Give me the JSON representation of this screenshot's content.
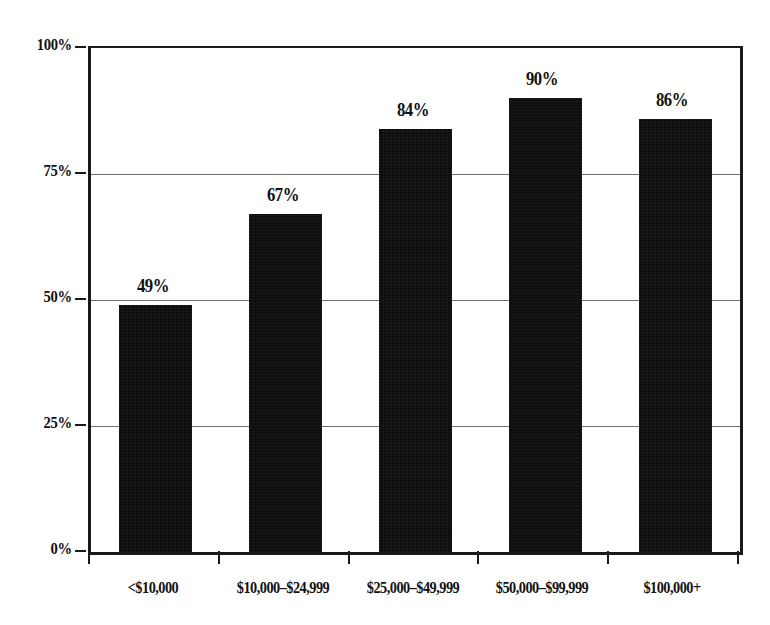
{
  "figure": {
    "title_remnant": "",
    "background_color": "#ffffff",
    "bar_color": "#0d0d0d",
    "axis_color": "#1a1a1a",
    "gridline_color": "#6f6f74"
  },
  "chart_data": {
    "type": "bar",
    "title": "",
    "xlabel": "",
    "ylabel": "",
    "categories": [
      "<$10,000",
      "$10,000–$24,999",
      "$25,000–$49,999",
      "$50,000–$99,999",
      "$100,000+"
    ],
    "values": [
      49,
      67,
      84,
      90,
      86
    ],
    "value_labels": [
      "49%",
      "67%",
      "84%",
      "90%",
      "86%"
    ],
    "ylim": [
      0,
      100
    ],
    "yticks": [
      0,
      25,
      50,
      75,
      100
    ],
    "ytick_labels": [
      "0%",
      "25%",
      "50%",
      "75%",
      "100%"
    ],
    "grid": true,
    "grid_axis": "y",
    "legend": false,
    "units": "percent"
  }
}
